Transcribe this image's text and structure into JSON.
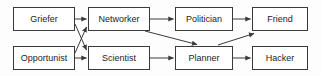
{
  "diagram": {
    "type": "directed-graph",
    "canvas": {
      "width": 321,
      "height": 76
    },
    "style": {
      "background_color": "#fdfdfd",
      "node_fill": "#ffffff",
      "node_border_color": "#3a3a3a",
      "edge_color": "#3a3a3a",
      "label_color": "#1c1c1c"
    },
    "nodes": [
      {
        "id": "griefer",
        "label": "Griefer",
        "x": 13,
        "y": 7,
        "w": 62,
        "h": 24,
        "row": "top",
        "col": 1
      },
      {
        "id": "networker",
        "label": "Networker",
        "x": 88,
        "y": 7,
        "w": 62,
        "h": 24,
        "row": "top",
        "col": 2
      },
      {
        "id": "politician",
        "label": "Politician",
        "x": 175,
        "y": 7,
        "w": 58,
        "h": 24,
        "row": "top",
        "col": 3
      },
      {
        "id": "friend",
        "label": "Friend",
        "x": 252,
        "y": 7,
        "w": 56,
        "h": 24,
        "row": "top",
        "col": 4
      },
      {
        "id": "opportunist",
        "label": "Opportunist",
        "x": 13,
        "y": 46,
        "w": 62,
        "h": 24,
        "row": "bottom",
        "col": 1
      },
      {
        "id": "scientist",
        "label": "Scientist",
        "x": 88,
        "y": 46,
        "w": 62,
        "h": 24,
        "row": "bottom",
        "col": 2
      },
      {
        "id": "planner",
        "label": "Planner",
        "x": 175,
        "y": 46,
        "w": 58,
        "h": 24,
        "row": "bottom",
        "col": 3
      },
      {
        "id": "hacker",
        "label": "Hacker",
        "x": 252,
        "y": 46,
        "w": 56,
        "h": 24,
        "row": "bottom",
        "col": 4
      }
    ],
    "edges": [
      {
        "id": "griefer-networker",
        "from": "Griefer",
        "to": "Networker",
        "kind": "horizontal"
      },
      {
        "id": "griefer-scientist",
        "from": "Griefer",
        "to": "Scientist",
        "kind": "diagonal-down"
      },
      {
        "id": "opportunist-networker",
        "from": "Opportunist",
        "to": "Networker",
        "kind": "diagonal-up"
      },
      {
        "id": "opportunist-scientist",
        "from": "Opportunist",
        "to": "Scientist",
        "kind": "horizontal"
      },
      {
        "id": "networker-politician",
        "from": "Networker",
        "to": "Politician",
        "kind": "horizontal"
      },
      {
        "id": "networker-planner",
        "from": "Networker",
        "to": "Planner",
        "kind": "diagonal-down"
      },
      {
        "id": "scientist-planner",
        "from": "Scientist",
        "to": "Planner",
        "kind": "horizontal"
      },
      {
        "id": "politician-friend",
        "from": "Politician",
        "to": "Friend",
        "kind": "horizontal"
      },
      {
        "id": "planner-friend",
        "from": "Planner",
        "to": "Friend",
        "kind": "diagonal-up"
      },
      {
        "id": "planner-hacker",
        "from": "Planner",
        "to": "Hacker",
        "kind": "horizontal"
      }
    ]
  }
}
